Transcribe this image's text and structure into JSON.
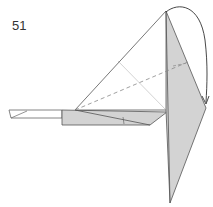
{
  "diagram": {
    "step_number": "51",
    "colors": {
      "paper_colored": "#d3d3d3",
      "paper_white": "#ffffff",
      "outline": "#555555",
      "crease": "#bbbbbb",
      "dashed_fold": "#888888",
      "arrow": "#333333"
    },
    "elements": [
      {
        "name": "step-number",
        "text": "51"
      },
      {
        "name": "model-triangle-white"
      },
      {
        "name": "vertical-flap-colored"
      },
      {
        "name": "horizontal-flap-colored"
      },
      {
        "name": "left-strip-white"
      },
      {
        "name": "valley-fold-line-dashed"
      },
      {
        "name": "fold-arrow"
      }
    ]
  }
}
